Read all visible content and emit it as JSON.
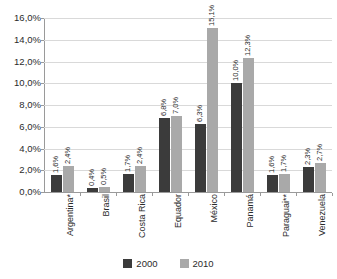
{
  "chart_data": {
    "type": "bar",
    "title": "",
    "xlabel": "",
    "ylabel": "",
    "ylim": [
      0,
      16
    ],
    "ytick_labels": [
      "16,0%",
      "14,0%",
      "12,0%",
      "10,0%",
      "8,0%",
      "6,0%",
      "4,0%",
      "2,0%",
      "0,0%"
    ],
    "ytick_values": [
      16,
      14,
      12,
      10,
      8,
      6,
      4,
      2,
      0
    ],
    "grid": true,
    "legend_position": "bottom",
    "categories": [
      "Argentina*",
      "Brasil",
      "Costa Rica",
      "Equador",
      "México",
      "Panamá",
      "Paraguai**",
      "Venezuela"
    ],
    "series": [
      {
        "name": "2000",
        "color": "#3b3b3b",
        "values": [
          1.6,
          0.4,
          1.7,
          6.8,
          6.3,
          10.0,
          1.6,
          2.3
        ],
        "labels": [
          "1,6%",
          "0,4%",
          "1,7%",
          "6,8%",
          "6,3%",
          "10,0%",
          "1,6%",
          "2,3%"
        ]
      },
      {
        "name": "2010",
        "color": "#a9a9a9",
        "values": [
          2.4,
          0.5,
          2.4,
          7.0,
          15.1,
          12.3,
          1.7,
          2.7
        ],
        "labels": [
          "2,4%",
          "0,5%",
          "2,4%",
          "7,0%",
          "15,1%",
          "12,3%",
          "1,7%",
          "2,7%"
        ]
      }
    ]
  }
}
